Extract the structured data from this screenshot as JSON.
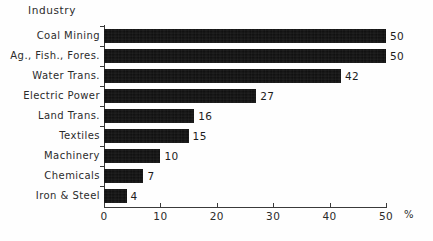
{
  "chart_data": {
    "type": "bar",
    "orientation": "horizontal",
    "title": "Industry",
    "xlabel": "%",
    "ylabel": "",
    "categories": [
      "Coal Mining",
      "Ag., Fish., Fores.",
      "Water Trans.",
      "Electric Power",
      "Land Trans.",
      "Textiles",
      "Machinery",
      "Chemicals",
      "Iron & Steel"
    ],
    "values": [
      50,
      50,
      42,
      27,
      16,
      15,
      10,
      7,
      4
    ],
    "value_labels": [
      "50",
      "50",
      "42",
      "27",
      "16",
      "15",
      "10",
      "7",
      "4"
    ],
    "xlim": [
      0,
      50
    ],
    "xticks": [
      0,
      10,
      20,
      30,
      40,
      50
    ],
    "xtick_labels": [
      "0",
      "10",
      "20",
      "30",
      "40",
      "50"
    ],
    "grid": false,
    "legend": false,
    "bar_color": "#0d0d0d",
    "background_color": "#fefefe",
    "axis_color": "#3a3a3a"
  }
}
